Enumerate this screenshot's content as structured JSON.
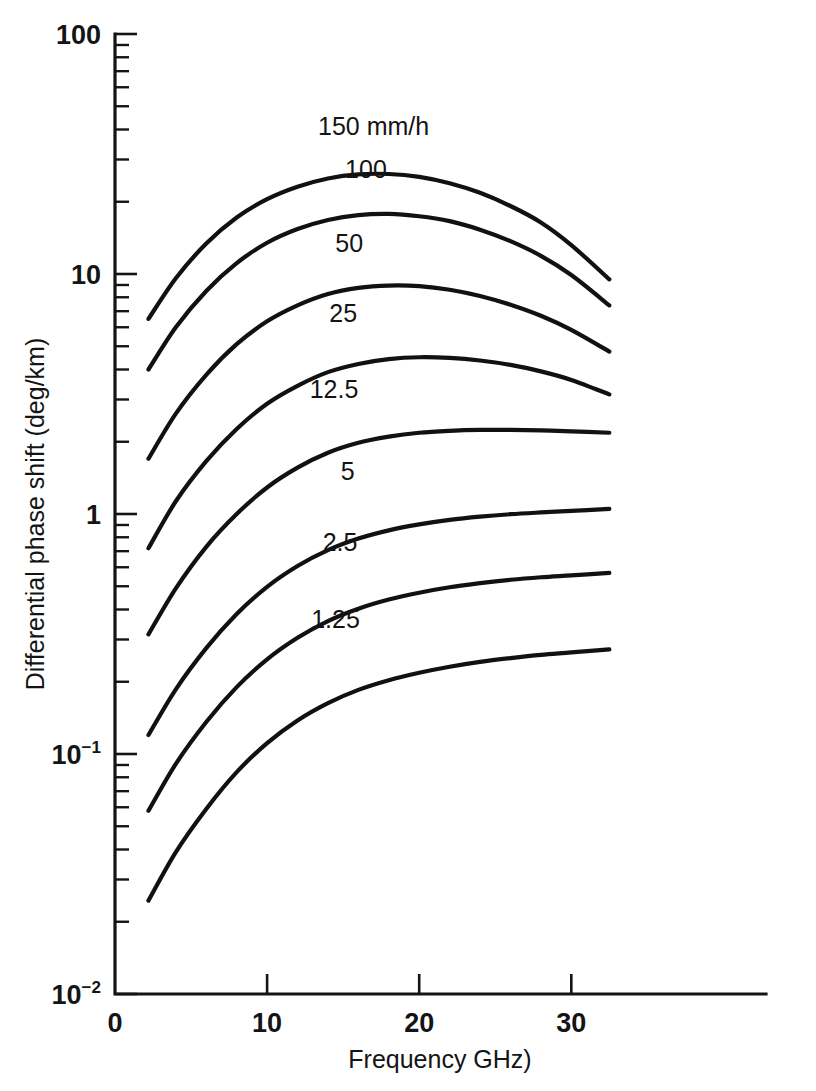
{
  "chart_data": {
    "type": "line",
    "title": "",
    "xlabel": "Frequency GHz)",
    "ylabel": "Differential phase shift (deg/km)",
    "xscale": "linear",
    "yscale": "log",
    "xlim": [
      0,
      42.8
    ],
    "ylim": [
      0.01,
      100
    ],
    "grid": false,
    "legend_position": "inline-curve-labels",
    "xticks": [
      {
        "value": 0,
        "label": "0"
      },
      {
        "value": 10,
        "label": "10"
      },
      {
        "value": 20,
        "label": "20"
      },
      {
        "value": 30,
        "label": "30"
      }
    ],
    "yticks": [
      {
        "value": 100,
        "label": "100",
        "exp": ""
      },
      {
        "value": 10,
        "label": "10",
        "exp": ""
      },
      {
        "value": 1,
        "label": "1",
        "exp": ""
      },
      {
        "value": 0.1,
        "label": "10",
        "exp": "−1"
      },
      {
        "value": 0.01,
        "label": "10",
        "exp": "−2"
      }
    ],
    "series": [
      {
        "name": "150",
        "label": "150 mm/h",
        "label_x": 17.0,
        "label_y": 38.0,
        "x": [
          2.2,
          4,
          6,
          8,
          10,
          12,
          14,
          16,
          18,
          20,
          22,
          24,
          26,
          28,
          30,
          32.5
        ],
        "y": [
          6.5,
          9.6,
          13.4,
          17.2,
          20.5,
          23.1,
          25.0,
          26.0,
          26.1,
          25.4,
          23.9,
          21.8,
          19.2,
          16.4,
          13.2,
          9.5
        ]
      },
      {
        "name": "100",
        "label": "100",
        "label_x": 16.5,
        "label_y": 25.0,
        "x": [
          2.2,
          4,
          6,
          8,
          10,
          12,
          14,
          16,
          18,
          20,
          22,
          24,
          26,
          28,
          30,
          32.5
        ],
        "y": [
          4.0,
          6.0,
          8.5,
          11.1,
          13.5,
          15.4,
          16.8,
          17.6,
          17.8,
          17.4,
          16.6,
          15.3,
          13.7,
          11.9,
          9.9,
          7.4
        ]
      },
      {
        "name": "50",
        "label": "50",
        "label_x": 15.4,
        "label_y": 12.4,
        "x": [
          2.2,
          4,
          6,
          8,
          10,
          12,
          14,
          16,
          18,
          20,
          22,
          24,
          26,
          28,
          30,
          32.5
        ],
        "y": [
          1.7,
          2.62,
          3.8,
          5.1,
          6.35,
          7.4,
          8.25,
          8.75,
          8.95,
          8.9,
          8.6,
          8.1,
          7.45,
          6.7,
          5.85,
          4.75
        ]
      },
      {
        "name": "25",
        "label": "25",
        "label_x": 15.0,
        "label_y": 6.3,
        "x": [
          2.2,
          4,
          6,
          8,
          10,
          12,
          14,
          16,
          18,
          20,
          22,
          24,
          26,
          28,
          30,
          32.5
        ],
        "y": [
          0.72,
          1.13,
          1.66,
          2.26,
          2.88,
          3.42,
          3.9,
          4.22,
          4.42,
          4.5,
          4.47,
          4.36,
          4.18,
          3.93,
          3.62,
          3.15
        ]
      },
      {
        "name": "12.5",
        "label": "12.5",
        "label_x": 14.4,
        "label_y": 3.05,
        "x": [
          2.2,
          4,
          6,
          8,
          10,
          12,
          14,
          16,
          18,
          20,
          22,
          24,
          26,
          28,
          30,
          32.5
        ],
        "y": [
          0.315,
          0.49,
          0.73,
          1.0,
          1.29,
          1.56,
          1.8,
          1.98,
          2.1,
          2.18,
          2.22,
          2.24,
          2.24,
          2.23,
          2.21,
          2.18
        ]
      },
      {
        "name": "5",
        "label": "5",
        "label_x": 15.3,
        "label_y": 1.38,
        "x": [
          2.2,
          4,
          6,
          8,
          10,
          12,
          14,
          16,
          18,
          20,
          22,
          24,
          26,
          28,
          30,
          32.5
        ],
        "y": [
          0.12,
          0.186,
          0.276,
          0.383,
          0.497,
          0.607,
          0.707,
          0.79,
          0.855,
          0.905,
          0.945,
          0.975,
          0.998,
          1.015,
          1.03,
          1.05
        ]
      },
      {
        "name": "2.5",
        "label": "2.5",
        "label_x": 14.8,
        "label_y": 0.7,
        "x": [
          2.2,
          4,
          6,
          8,
          10,
          12,
          14,
          16,
          18,
          20,
          22,
          24,
          26,
          28,
          30,
          32.5
        ],
        "y": [
          0.058,
          0.091,
          0.136,
          0.19,
          0.248,
          0.305,
          0.358,
          0.403,
          0.44,
          0.47,
          0.495,
          0.515,
          0.532,
          0.545,
          0.555,
          0.568
        ]
      },
      {
        "name": "1.25",
        "label": "1.25",
        "label_x": 14.5,
        "label_y": 0.335,
        "x": [
          2.2,
          4,
          6,
          8,
          10,
          12,
          14,
          16,
          18,
          20,
          22,
          24,
          26,
          28,
          30,
          32.5
        ],
        "y": [
          0.0245,
          0.039,
          0.059,
          0.084,
          0.111,
          0.138,
          0.163,
          0.185,
          0.203,
          0.218,
          0.231,
          0.242,
          0.251,
          0.259,
          0.265,
          0.273
        ]
      }
    ]
  }
}
